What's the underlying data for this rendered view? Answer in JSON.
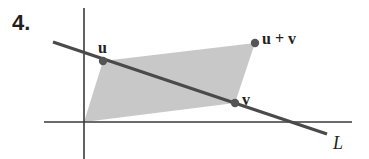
{
  "problem_number": "4.",
  "labels": {
    "u": "u",
    "u_plus_v": "u + v",
    "v": "v",
    "line": "L"
  },
  "colors": {
    "ink": "#3a3a3a",
    "line": "#4a4a4a",
    "fill": "#c8c8c8",
    "point": "#555555"
  },
  "geometry": {
    "origin": [
      84,
      122
    ],
    "u": [
      103,
      61
    ],
    "v": [
      235,
      103
    ],
    "u_plus_v": [
      255,
      43
    ],
    "line_L": [
      [
        53,
        42
      ],
      [
        327,
        134
      ]
    ]
  }
}
